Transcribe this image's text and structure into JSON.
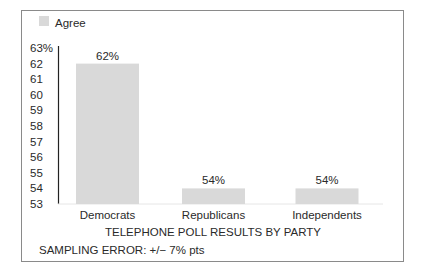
{
  "chart_data": {
    "type": "bar",
    "title": "",
    "categories": [
      "Democrats",
      "Republicans",
      "Independents"
    ],
    "series": [
      {
        "name": "Agree",
        "values": [
          62,
          54,
          54
        ]
      }
    ],
    "data_labels": [
      "62%",
      "54%",
      "54%"
    ],
    "xlabel": "TELEPHONE POLL RESULTS BY PARTY",
    "ylabel": "",
    "ylim": [
      53,
      63
    ],
    "y_ticks": [
      53,
      54,
      55,
      56,
      57,
      58,
      59,
      60,
      61,
      62,
      63
    ],
    "y_tick_labels": [
      "53",
      "54",
      "55",
      "56",
      "57",
      "58",
      "59",
      "60",
      "61",
      "62",
      "63%"
    ],
    "grid": false,
    "legend": {
      "position": "top-left",
      "entries": [
        "Agree"
      ]
    },
    "annotations": [
      "SAMPLING ERROR: +/− 7% pts"
    ],
    "colors": {
      "bar": "#d9d9d9",
      "axis": "#222222",
      "frame": "#8a8a8a"
    }
  }
}
